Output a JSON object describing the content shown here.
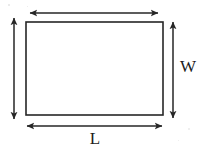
{
  "diagram": {
    "type": "geometry-figure",
    "background_color": "#ffffff",
    "stroke_color": "#262626",
    "label_color": "#1c1c1c",
    "shape": {
      "name": "rectangle",
      "x": 26,
      "y": 22,
      "width": 137,
      "height": 93,
      "stroke_width": 1.6,
      "fill": "none"
    },
    "dimensions": [
      {
        "id": "width-top",
        "label": "",
        "orientation": "horizontal",
        "arrowheads": "both",
        "x1": 30,
        "y1": 13,
        "x2": 158,
        "y2": 13
      },
      {
        "id": "length-bottom",
        "label": "L",
        "orientation": "horizontal",
        "arrowheads": "both",
        "x1": 27,
        "y1": 126,
        "x2": 162,
        "y2": 126,
        "label_x": 95,
        "label_y": 140
      },
      {
        "id": "height-left",
        "label": "",
        "orientation": "vertical",
        "arrowheads": "both",
        "x1": 14,
        "y1": 18,
        "x2": 14,
        "y2": 119
      },
      {
        "id": "width-right",
        "label": "W",
        "orientation": "vertical",
        "arrowheads": "both",
        "x1": 173,
        "y1": 22,
        "x2": 173,
        "y2": 118,
        "label_x": 188,
        "label_y": 68
      }
    ],
    "labels": {
      "length": "L",
      "width": "W"
    }
  }
}
